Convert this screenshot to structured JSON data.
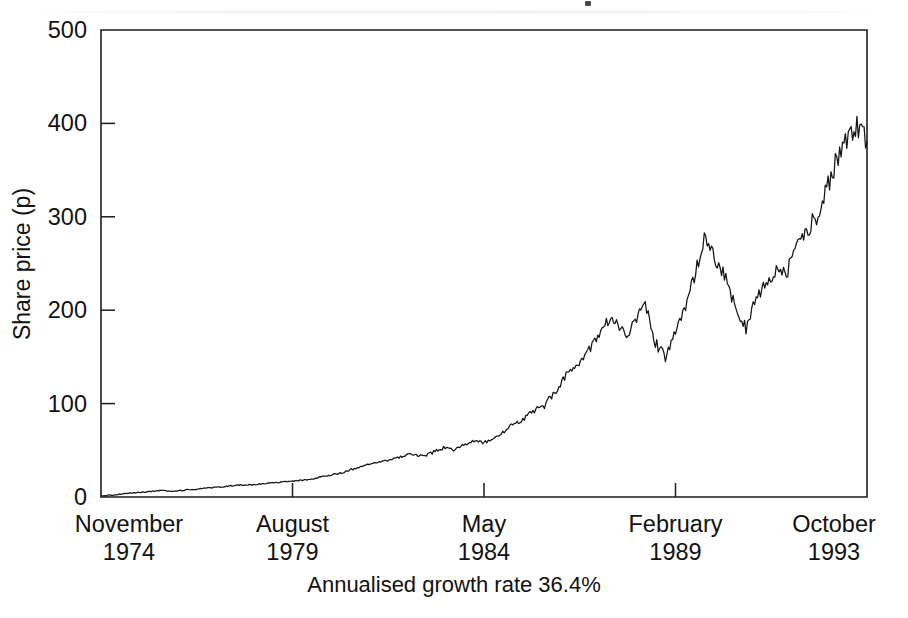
{
  "figure": {
    "name": "share-price-history-chart",
    "caption": "Annualised growth rate 36.4%",
    "line_color": "#141414",
    "axis_color": "#1d1d1d",
    "background_color": "#ffffff"
  },
  "chart_data": {
    "type": "line",
    "title": "",
    "subtitle": "",
    "xlabel": "",
    "ylabel": "Share price (p)",
    "annotation": "Annualised growth rate 36.4%",
    "grid": false,
    "legend": "none",
    "ylim": [
      0,
      500
    ],
    "yticks": [
      0,
      100,
      200,
      300,
      400,
      500
    ],
    "ytick_labels": [
      "0",
      "100",
      "200",
      "300",
      "400",
      "500"
    ],
    "xlim": [
      "November 1974",
      "October 1993"
    ],
    "xticks": [
      "November 1974",
      "August 1979",
      "May 1984",
      "February 1989",
      "October 1993"
    ],
    "xtick_months": [
      "November",
      "August",
      "May",
      "February",
      "October"
    ],
    "xtick_years": [
      "1974",
      "1979",
      "1984",
      "1989",
      "1993"
    ],
    "series": [
      {
        "name": "Share price",
        "units": "pence",
        "x": [
          "1974-11",
          "1975-02",
          "1975-05",
          "1975-08",
          "1975-11",
          "1976-02",
          "1976-05",
          "1976-08",
          "1976-11",
          "1977-02",
          "1977-05",
          "1977-08",
          "1977-11",
          "1978-02",
          "1978-05",
          "1978-08",
          "1978-11",
          "1979-02",
          "1979-05",
          "1979-08",
          "1979-11",
          "1980-02",
          "1980-05",
          "1980-08",
          "1980-11",
          "1981-02",
          "1981-05",
          "1981-08",
          "1981-11",
          "1982-02",
          "1982-05",
          "1982-08",
          "1982-11",
          "1983-02",
          "1983-05",
          "1983-08",
          "1983-11",
          "1984-02",
          "1984-05",
          "1984-08",
          "1984-11",
          "1985-02",
          "1985-05",
          "1985-08",
          "1985-11",
          "1986-02",
          "1986-05",
          "1986-08",
          "1986-11",
          "1987-02",
          "1987-05",
          "1987-08",
          "1987-11",
          "1988-02",
          "1988-05",
          "1988-08",
          "1988-11",
          "1989-02",
          "1989-05",
          "1989-08",
          "1989-11",
          "1990-02",
          "1990-05",
          "1990-08",
          "1990-11",
          "1991-02",
          "1991-05",
          "1991-08",
          "1991-11",
          "1992-02",
          "1992-05",
          "1992-08",
          "1992-11",
          "1993-02",
          "1993-05",
          "1993-08",
          "1993-10"
        ],
        "values": [
          1,
          2,
          3,
          4,
          5,
          6,
          7,
          6,
          7,
          8,
          9,
          10,
          11,
          12,
          13,
          13,
          14,
          15,
          16,
          17,
          18,
          19,
          22,
          24,
          26,
          30,
          33,
          36,
          38,
          41,
          44,
          46,
          44,
          48,
          53,
          51,
          55,
          60,
          58,
          64,
          70,
          78,
          84,
          92,
          98,
          112,
          128,
          140,
          150,
          165,
          188,
          190,
          172,
          185,
          210,
          165,
          150,
          175,
          205,
          240,
          280,
          255,
          235,
          200,
          180,
          215,
          230,
          245,
          240,
          265,
          285,
          300,
          330,
          360,
          385,
          400,
          380
        ],
        "min": 1,
        "max": 415,
        "start_value": 1,
        "end_value": 380
      }
    ]
  },
  "axes": {
    "y_title": "Share price (p)",
    "y_ticks": [
      {
        "label": "500",
        "value": 500
      },
      {
        "label": "400",
        "value": 400
      },
      {
        "label": "300",
        "value": 300
      },
      {
        "label": "200",
        "value": 200
      },
      {
        "label": "100",
        "value": 100
      },
      {
        "label": "0",
        "value": 0
      }
    ],
    "x_ticks": [
      {
        "month": "November",
        "year": "1974"
      },
      {
        "month": "August",
        "year": "1979"
      },
      {
        "month": "May",
        "year": "1984"
      },
      {
        "month": "February",
        "year": "1989"
      },
      {
        "month": "October",
        "year": "1993"
      }
    ]
  }
}
